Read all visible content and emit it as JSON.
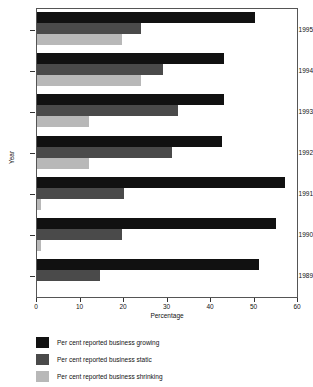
{
  "chart_data": {
    "type": "bar",
    "orientation": "horizontal",
    "title": "",
    "xlabel": "Percentage",
    "ylabel": "Year",
    "xlim": [
      0,
      60
    ],
    "xticks": [
      0,
      10,
      20,
      30,
      40,
      50,
      60
    ],
    "grid": false,
    "legend_position": "below-plot",
    "categories": [
      "1995",
      "1994",
      "1993",
      "1992",
      "1991",
      "1990",
      "1989"
    ],
    "series": [
      {
        "name": "Per cent reported business growing",
        "color": "#111111",
        "values": [
          50,
          43,
          43,
          42.5,
          57,
          55,
          51
        ]
      },
      {
        "name": "Per cent reported business static",
        "color": "#4a4a4a",
        "values": [
          24,
          29,
          32.5,
          31,
          20,
          19.5,
          14.5
        ]
      },
      {
        "name": "Per cent reported business shrinking",
        "color": "#b8b8b8",
        "values": [
          19.5,
          24,
          12,
          12,
          1,
          1,
          0
        ]
      }
    ]
  },
  "axes": {
    "y_tick_labels": [
      "1995",
      "1994",
      "1993",
      "1992",
      "1991",
      "1990",
      "1989"
    ],
    "x_tick_labels": [
      "0",
      "10",
      "20",
      "30",
      "40",
      "50",
      "60"
    ],
    "x_axis_title": "Percentage",
    "y_axis_title": "Year"
  },
  "legend": {
    "items": [
      {
        "label": "Per cent reported business growing",
        "color": "#111111",
        "key": "growing"
      },
      {
        "label": "Per cent reported business static",
        "color": "#4a4a4a",
        "key": "static"
      },
      {
        "label": "Per cent reported business shrinking",
        "color": "#b8b8b8",
        "key": "shrinking"
      }
    ]
  }
}
